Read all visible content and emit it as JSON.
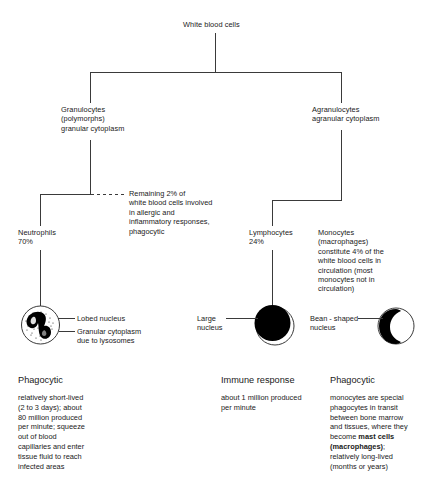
{
  "diagram": {
    "root": {
      "label": "White blood cells"
    },
    "branches": [
      {
        "id": "granulocytes",
        "label": "Granulocytes\n(polymorphs)\ngranular cytoplasm"
      },
      {
        "id": "agranulocytes",
        "label": "Agranulocytes\nagranular cytoplasm"
      }
    ],
    "leaves": [
      {
        "id": "neutrophils",
        "label": "Neutrophils\n70%"
      },
      {
        "id": "lymphocytes",
        "label": "Lymphocytes\n24%"
      },
      {
        "id": "monocytes",
        "label": "Monocytes\n(macrophages)\nconstitute 4% of the\nwhite blood cells in\ncirculation (most\nmonocytes not in\ncirculation)"
      }
    ],
    "callout": {
      "id": "remaining-granulocytes",
      "text": "Remaining 2% of\nwhite blood cells involved\nin allergic and\ninflammatory responses,\nphagocytic"
    },
    "cells": [
      {
        "id": "neutrophil-cell",
        "icon": "neutrophil-cell-icon",
        "labels": [
          {
            "id": "lobed-nucleus",
            "text": "Lobed nucleus"
          },
          {
            "id": "granular-cytoplasm",
            "text": "Granular cytoplasm\ndue to lysosomes"
          }
        ]
      },
      {
        "id": "lymphocyte-cell",
        "icon": "lymphocyte-cell-icon",
        "labels": [
          {
            "id": "large-nucleus",
            "text": "Large\nnucleus"
          }
        ]
      },
      {
        "id": "monocyte-cell",
        "icon": "monocyte-cell-icon",
        "labels": [
          {
            "id": "bean-shaped-nucleus",
            "text": "Bean - shaped\nnucleus"
          }
        ]
      }
    ],
    "summaries": [
      {
        "id": "neutrophil-summary",
        "title": "Phagocytic",
        "body": "relatively short-lived\n(2 to 3 days); about\n80 million produced\nper minute; squeeze\nout of blood\ncapillaries and enter\ntissue fluid to reach\ninfected areas"
      },
      {
        "id": "lymphocyte-summary",
        "title": "Immune response",
        "body": "about 1 million produced\nper minute"
      },
      {
        "id": "monocyte-summary",
        "title": "Phagocytic",
        "body_part1": "monocytes are special\nphagocytes in transit\nbetween bone marrow\nand tissues, where they\nbecome ",
        "body_bold": "mast cells\n(macrophages)",
        "body_part2": ";\nrelatively long-lived\n(months or years)"
      }
    ],
    "colors": {
      "line": "#3a3a3a",
      "nucleus": "#000000",
      "background": "#ffffff",
      "text": "#1a1a1a"
    }
  }
}
